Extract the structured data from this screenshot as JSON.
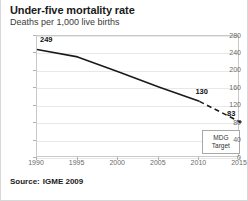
{
  "title": "Under-five mortality rate",
  "subtitle": "Deaths per 1,000 live births",
  "source": {
    "label": "Source:",
    "value": "IGME 2009"
  },
  "annotation_box": {
    "line1": "MDG",
    "line2": "Target"
  },
  "colors": {
    "line": "#1a1a1a",
    "grid": "#e8e8e8",
    "axis_text": "#6b6b6b",
    "frame": "#c9c9c9",
    "page_border": "#d8d8d8"
  },
  "chart_data": {
    "type": "line",
    "title": "Under-five mortality rate",
    "subtitle": "Deaths per 1,000 live births",
    "xlabel": "",
    "ylabel": "Deaths per 1,000 live births",
    "xlim": [
      1990,
      2015
    ],
    "ylim": [
      0,
      280
    ],
    "xticks": [
      1990,
      1995,
      2000,
      2005,
      2010,
      2015
    ],
    "yticks": [
      0,
      40,
      80,
      120,
      160,
      200,
      240,
      280
    ],
    "grid": true,
    "legend": false,
    "series": [
      {
        "name": "Observed under-five mortality rate",
        "style": "solid",
        "x": [
          1990,
          1995,
          2000,
          2005,
          2010
        ],
        "values": [
          249,
          232,
          198,
          163,
          130
        ]
      },
      {
        "name": "Projection to MDG target",
        "style": "dashed",
        "x": [
          2010,
          2015
        ],
        "values": [
          130,
          83
        ]
      }
    ],
    "point_labels": [
      {
        "x": 1990,
        "value": 249,
        "text": "249"
      },
      {
        "x": 2010,
        "value": 130,
        "text": "130"
      },
      {
        "x": 2015,
        "value": 83,
        "text": "83"
      }
    ],
    "annotations": [
      {
        "text": "MDG Target",
        "x": 2014,
        "y": 45
      }
    ]
  }
}
